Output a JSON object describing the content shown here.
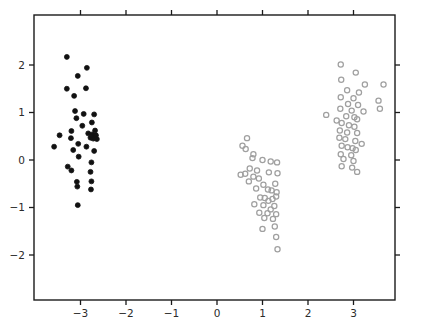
{
  "chart_data": {
    "type": "scatter",
    "title": "",
    "subtitle": "",
    "xlabel": "",
    "ylabel": "",
    "xlim": [
      -3.93,
      4.0
    ],
    "ylim": [
      -2.95,
      2.95
    ],
    "xticks": [
      -3,
      -2,
      -1,
      0,
      1,
      2,
      3
    ],
    "xticklabels": [
      "−3",
      "−2",
      "−1",
      "0",
      "1",
      "2",
      "3"
    ],
    "yticks": [
      -2,
      -1,
      0,
      1,
      2
    ],
    "yticklabels": [
      "−2",
      "−1",
      "0",
      "1",
      "2"
    ],
    "grid": false,
    "legend": null,
    "legend_position": "none",
    "frame": true,
    "tick_direction": "out-all-sides",
    "marker_size_px": 5.2,
    "series": [
      {
        "name": "cluster-1",
        "marker": "filled-circle",
        "color": "#111111",
        "fill": "#111111",
        "points": [
          [
            -3.3,
            2.17
          ],
          [
            -2.86,
            1.94
          ],
          [
            -3.06,
            1.77
          ],
          [
            -3.3,
            1.5
          ],
          [
            -2.88,
            1.51
          ],
          [
            -3.14,
            1.35
          ],
          [
            -3.12,
            1.03
          ],
          [
            -2.93,
            0.97
          ],
          [
            -2.7,
            0.96
          ],
          [
            -3.09,
            0.88
          ],
          [
            -2.75,
            0.79
          ],
          [
            -3.2,
            0.61
          ],
          [
            -2.96,
            0.72
          ],
          [
            -3.46,
            0.52
          ],
          [
            -2.68,
            0.62
          ],
          [
            -2.83,
            0.56
          ],
          [
            -2.74,
            0.54
          ],
          [
            -2.7,
            0.5
          ],
          [
            -2.66,
            0.52
          ],
          [
            -2.72,
            0.45
          ],
          [
            -2.78,
            0.47
          ],
          [
            -2.64,
            0.44
          ],
          [
            -3.21,
            0.46
          ],
          [
            -3.58,
            0.28
          ],
          [
            -3.05,
            0.34
          ],
          [
            -2.87,
            0.28
          ],
          [
            -3.16,
            0.21
          ],
          [
            -2.7,
            0.19
          ],
          [
            -3.04,
            0.07
          ],
          [
            -2.76,
            -0.05
          ],
          [
            -3.28,
            -0.14
          ],
          [
            -3.2,
            -0.22
          ],
          [
            -2.78,
            -0.25
          ],
          [
            -3.08,
            -0.46
          ],
          [
            -2.76,
            -0.45
          ],
          [
            -3.07,
            -0.56
          ],
          [
            -2.77,
            -0.62
          ],
          [
            -3.06,
            -0.95
          ]
        ]
      },
      {
        "name": "cluster-2",
        "marker": "open-circle",
        "color": "#a0a0a0",
        "fill": "none",
        "points": [
          [
            0.66,
            0.46
          ],
          [
            0.56,
            0.3
          ],
          [
            0.63,
            0.23
          ],
          [
            0.8,
            0.12
          ],
          [
            0.78,
            0.04
          ],
          [
            1.0,
            0.0
          ],
          [
            1.18,
            -0.03
          ],
          [
            1.32,
            -0.05
          ],
          [
            0.72,
            -0.18
          ],
          [
            0.52,
            -0.31
          ],
          [
            0.62,
            -0.29
          ],
          [
            0.88,
            -0.22
          ],
          [
            1.14,
            -0.26
          ],
          [
            1.33,
            -0.28
          ],
          [
            0.8,
            -0.35
          ],
          [
            0.92,
            -0.39
          ],
          [
            0.7,
            -0.45
          ],
          [
            1.02,
            -0.52
          ],
          [
            1.28,
            -0.5
          ],
          [
            0.86,
            -0.6
          ],
          [
            1.12,
            -0.62
          ],
          [
            1.2,
            -0.64
          ],
          [
            1.31,
            -0.68
          ],
          [
            1.3,
            -0.77
          ],
          [
            0.95,
            -0.79
          ],
          [
            1.05,
            -0.8
          ],
          [
            1.22,
            -0.82
          ],
          [
            1.13,
            -0.86
          ],
          [
            0.82,
            -0.93
          ],
          [
            1.02,
            -0.95
          ],
          [
            1.26,
            -0.97
          ],
          [
            1.18,
            -1.04
          ],
          [
            0.93,
            -1.11
          ],
          [
            1.11,
            -1.12
          ],
          [
            1.3,
            -1.14
          ],
          [
            1.04,
            -1.22
          ],
          [
            1.23,
            -1.24
          ],
          [
            1.0,
            -1.45
          ],
          [
            1.27,
            -1.4
          ],
          [
            1.3,
            -1.62
          ],
          [
            1.33,
            -1.88
          ]
        ]
      },
      {
        "name": "cluster-3",
        "marker": "open-circle",
        "color": "#a0a0a0",
        "fill": "none",
        "points": [
          [
            2.72,
            2.01
          ],
          [
            3.05,
            1.84
          ],
          [
            2.73,
            1.69
          ],
          [
            3.25,
            1.59
          ],
          [
            3.66,
            1.59
          ],
          [
            2.86,
            1.47
          ],
          [
            3.12,
            1.42
          ],
          [
            2.72,
            1.32
          ],
          [
            3.0,
            1.3
          ],
          [
            3.55,
            1.25
          ],
          [
            2.88,
            1.18
          ],
          [
            3.1,
            1.16
          ],
          [
            2.71,
            1.08
          ],
          [
            2.96,
            1.04
          ],
          [
            3.22,
            1.02
          ],
          [
            3.58,
            1.08
          ],
          [
            2.4,
            0.95
          ],
          [
            2.84,
            0.92
          ],
          [
            3.02,
            0.9
          ],
          [
            3.08,
            0.86
          ],
          [
            2.63,
            0.83
          ],
          [
            2.74,
            0.78
          ],
          [
            2.9,
            0.73
          ],
          [
            3.02,
            0.7
          ],
          [
            2.7,
            0.62
          ],
          [
            2.86,
            0.58
          ],
          [
            3.08,
            0.57
          ],
          [
            2.69,
            0.47
          ],
          [
            2.82,
            0.44
          ],
          [
            3.04,
            0.4
          ],
          [
            3.18,
            0.34
          ],
          [
            2.74,
            0.3
          ],
          [
            2.87,
            0.27
          ],
          [
            2.98,
            0.25
          ],
          [
            3.05,
            0.21
          ],
          [
            2.72,
            0.12
          ],
          [
            2.95,
            0.1
          ],
          [
            2.78,
            0.02
          ],
          [
            3.0,
            -0.02
          ],
          [
            2.74,
            -0.13
          ],
          [
            2.97,
            -0.16
          ],
          [
            3.08,
            -0.25
          ]
        ]
      }
    ],
    "axes_geometry": {
      "left_px": 34,
      "right_px": 395,
      "top_px": 15,
      "bottom_px": 300,
      "x_origin_px": 217,
      "y_origin_px": 160,
      "x_unit_px": 45.5,
      "y_unit_px": 47.5
    }
  }
}
